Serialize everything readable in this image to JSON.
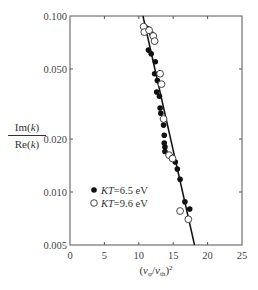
{
  "chart_data": {
    "type": "scatter",
    "title": "",
    "xlabel": "(v_φ/v_th)^2",
    "ylabel": "Im(k) / Re(k)",
    "ylabel_parts": {
      "numerator": "Im(k)",
      "denominator": "Re(k)"
    },
    "xlim": [
      0,
      25
    ],
    "ylim": [
      0.005,
      0.1
    ],
    "yscale": "log",
    "x_ticks": [
      0,
      5,
      10,
      15,
      20,
      25
    ],
    "x_tick_labels": [
      "0",
      "5",
      "10",
      "15",
      "20",
      "25"
    ],
    "y_ticks": [
      0.005,
      0.01,
      0.02,
      0.05,
      0.1
    ],
    "y_tick_labels": [
      "0.005",
      "0.010",
      "0.020",
      "0.050",
      "0.100"
    ],
    "grid": false,
    "legend_position": "lower-left inside",
    "series": [
      {
        "name": "KT=6.5 eV",
        "marker": "filled-circle",
        "points": [
          [
            11.2,
            0.085
          ],
          [
            11.9,
            0.079
          ],
          [
            11.4,
            0.064
          ],
          [
            11.8,
            0.061
          ],
          [
            12.4,
            0.055
          ],
          [
            12.3,
            0.047
          ],
          [
            12.7,
            0.043
          ],
          [
            12.6,
            0.037
          ],
          [
            13.0,
            0.035
          ],
          [
            13.1,
            0.03
          ],
          [
            13.2,
            0.028
          ],
          [
            13.6,
            0.024
          ],
          [
            13.7,
            0.021
          ],
          [
            13.7,
            0.019
          ],
          [
            13.8,
            0.018
          ],
          [
            13.8,
            0.017
          ],
          [
            14.8,
            0.0158
          ],
          [
            15.3,
            0.0148
          ],
          [
            15.6,
            0.0135
          ],
          [
            16.0,
            0.0118
          ],
          [
            16.7,
            0.0088
          ],
          [
            17.4,
            0.008
          ]
        ]
      },
      {
        "name": "KT=9.6 eV",
        "marker": "open-circle",
        "points": [
          [
            10.7,
            0.087
          ],
          [
            10.8,
            0.081
          ],
          [
            11.5,
            0.083
          ],
          [
            12.1,
            0.077
          ],
          [
            12.3,
            0.072
          ],
          [
            13.1,
            0.047
          ],
          [
            13.3,
            0.041
          ],
          [
            13.6,
            0.026
          ],
          [
            14.4,
            0.0162
          ],
          [
            14.9,
            0.0155
          ],
          [
            16.0,
            0.0078
          ],
          [
            17.2,
            0.007
          ]
        ]
      },
      {
        "name": "fit",
        "type": "line",
        "points": [
          [
            10.6,
            0.1
          ],
          [
            18.1,
            0.005
          ]
        ]
      }
    ],
    "legend": [
      {
        "marker": "filled-circle",
        "label": "KT=6.5 eV"
      },
      {
        "marker": "open-circle",
        "label": "KT=9.6 eV"
      }
    ]
  }
}
